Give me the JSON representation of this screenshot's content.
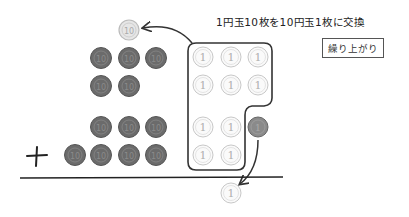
{
  "title": "1円玉10枚を10円玉1枚に交換",
  "badge": "繰り上がり",
  "operator": "+",
  "coins": {
    "ten_yen_label": "10",
    "one_yen_label": "1"
  },
  "colors": {
    "dark_coin": "#6b6b6b",
    "light_coin": "#e4e4e4",
    "outline": "#333333"
  }
}
